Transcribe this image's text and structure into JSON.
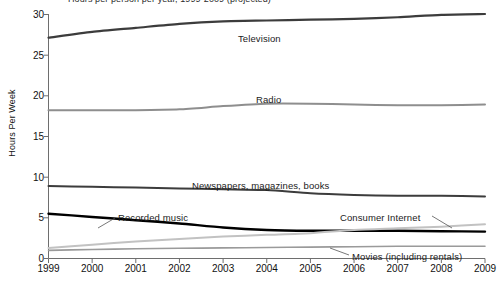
{
  "chart_data": {
    "type": "line",
    "title": "Hours per person per year, 1999-2009 (projected)",
    "title_truncated": true,
    "xlabel": "",
    "ylabel": "Hours Per Week",
    "x": [
      1999,
      2000,
      2001,
      2002,
      2003,
      2004,
      2005,
      2006,
      2007,
      2008,
      2009
    ],
    "xticklabels": [
      "1999",
      "2000",
      "2001",
      "2002",
      "2003",
      "2004",
      "2005",
      "2006",
      "2007",
      "2008",
      "2009"
    ],
    "yticklabels": [
      "0",
      "5",
      "10",
      "15",
      "20",
      "25",
      "30"
    ],
    "yticks": [
      0,
      5,
      10,
      15,
      20,
      25,
      30
    ],
    "ylim": [
      0,
      30
    ],
    "xlim": [
      1999,
      2009
    ],
    "grid": false,
    "legend": "inline-labels",
    "series": [
      {
        "name": "Television",
        "color": "#3c3c3c",
        "width": 2.2,
        "label_x": 238,
        "label_y": 33,
        "leader": false,
        "values": [
          27.1,
          27.8,
          28.3,
          28.8,
          29.1,
          29.2,
          29.3,
          29.4,
          29.6,
          29.9,
          30.0
        ]
      },
      {
        "name": "Radio",
        "color": "#8e8e8e",
        "width": 2.0,
        "label_x": 256,
        "label_y": 94,
        "leader": false,
        "values": [
          18.2,
          18.2,
          18.2,
          18.3,
          18.7,
          19.0,
          19.0,
          18.9,
          18.8,
          18.8,
          18.9
        ]
      },
      {
        "name": "Newspapers, magazines, books",
        "color": "#3c3c3c",
        "width": 2.0,
        "label_x": 192,
        "label_y": 180,
        "leader": false,
        "values": [
          8.9,
          8.8,
          8.7,
          8.6,
          8.5,
          8.4,
          8.0,
          7.8,
          7.7,
          7.7,
          7.6
        ]
      },
      {
        "name": "Recorded music",
        "color": "#000000",
        "width": 2.4,
        "label_x": 118,
        "label_y": 212,
        "leader": true,
        "leader_path": "M 115 218 L 98 228",
        "values": [
          5.5,
          5.1,
          4.7,
          4.3,
          3.8,
          3.5,
          3.4,
          3.4,
          3.4,
          3.35,
          3.3
        ]
      },
      {
        "name": "Consumer Internet",
        "color": "#c2c2c2",
        "width": 2.0,
        "label_x": 340,
        "label_y": 212,
        "leader": true,
        "leader_path": "M 432 216 L 452 228",
        "values": [
          1.3,
          1.7,
          2.1,
          2.4,
          2.7,
          2.9,
          3.1,
          3.5,
          3.7,
          3.9,
          4.2
        ]
      },
      {
        "name": "Movies (including rentals)",
        "color": "#9a9a9a",
        "width": 1.6,
        "label_x": 352,
        "label_y": 251,
        "leader": true,
        "leader_path": "M 349 255 L 330 248",
        "values": [
          1.0,
          1.1,
          1.2,
          1.25,
          1.3,
          1.35,
          1.4,
          1.45,
          1.5,
          1.5,
          1.5
        ]
      }
    ]
  },
  "axes": {
    "y_axis_title": "Hours Per Week"
  }
}
